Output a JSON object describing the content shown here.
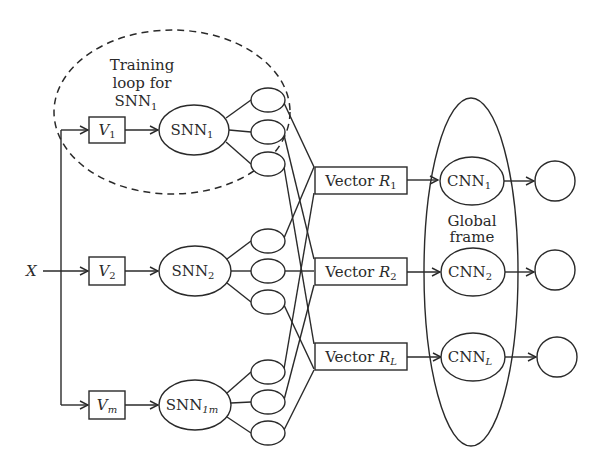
{
  "input": {
    "label": "X"
  },
  "training_loop": {
    "line1": "Training",
    "line2": "loop for",
    "line3_main": "SNN",
    "line3_sub": "1"
  },
  "vectors_in": [
    {
      "main": "V",
      "sub": "1"
    },
    {
      "main": "V",
      "sub": "2"
    },
    {
      "main": "V",
      "sub": "m"
    }
  ],
  "snns": [
    {
      "main": "SNN",
      "sub": "1"
    },
    {
      "main": "SNN",
      "sub": "2"
    },
    {
      "main": "SNN",
      "sub": "1m"
    }
  ],
  "vectors_out": [
    {
      "main": "Vector ",
      "var": "R",
      "sub": "1"
    },
    {
      "main": "Vector ",
      "var": "R",
      "sub": "2"
    },
    {
      "main": "Vector ",
      "var": "R",
      "sub": "L"
    }
  ],
  "global_frame": {
    "line1": "Global",
    "line2": "frame"
  },
  "cnns": [
    {
      "main": "CNN",
      "sub": "1"
    },
    {
      "main": "CNN",
      "sub": "2"
    },
    {
      "main": "CNN",
      "sub": "L"
    }
  ],
  "colors": {
    "stroke": "#2a2a2a",
    "background": "#ffffff"
  }
}
